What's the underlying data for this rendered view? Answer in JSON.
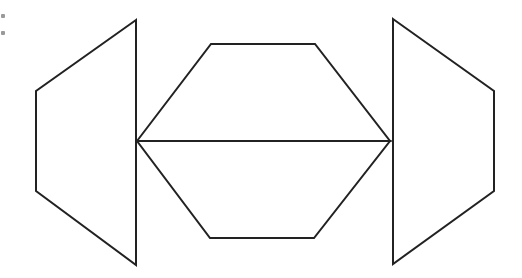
{
  "diagram": {
    "stroke_color": "#222222",
    "fill_color": "#ffffff",
    "stroke_width": 2,
    "shapes": [
      {
        "id": "left-trapezoid",
        "type": "polygon",
        "points": [
          [
            136,
            20
          ],
          [
            36,
            91
          ],
          [
            36,
            191
          ],
          [
            136,
            265
          ]
        ]
      },
      {
        "id": "hexagon-upper-half",
        "type": "polygon",
        "points": [
          [
            137,
            141
          ],
          [
            211,
            44
          ],
          [
            315,
            44
          ],
          [
            390,
            141
          ]
        ]
      },
      {
        "id": "hexagon-lower-half",
        "type": "polygon",
        "points": [
          [
            137,
            141
          ],
          [
            390,
            141
          ],
          [
            314,
            238
          ],
          [
            210,
            238
          ]
        ]
      },
      {
        "id": "right-trapezoid",
        "type": "polygon",
        "points": [
          [
            393,
            19
          ],
          [
            494,
            91
          ],
          [
            494,
            191
          ],
          [
            393,
            264
          ]
        ]
      }
    ],
    "edge_marks": [
      {
        "x": 1,
        "y": 14
      },
      {
        "x": 1,
        "y": 31
      }
    ]
  }
}
